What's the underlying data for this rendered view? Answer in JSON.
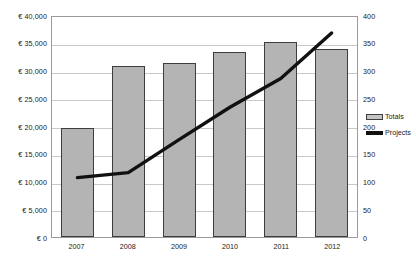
{
  "chart_data": {
    "type": "bar",
    "title": "",
    "xlabel": "",
    "ylabel": "",
    "categories": [
      "2007",
      "2008",
      "2009",
      "2010",
      "2011",
      "2012"
    ],
    "grid": true,
    "legend_position": "right",
    "axes": {
      "left": {
        "label": "",
        "ylim": [
          0,
          40000
        ],
        "tick_step": 5000,
        "ticks": [
          "€ 0",
          "€ 5,000",
          "€ 10,000",
          "€ 15,000",
          "€ 20,000",
          "€ 25,000",
          "€ 30,000",
          "€ 35,000",
          "€ 40,000"
        ],
        "tick_values": [
          0,
          5000,
          10000,
          15000,
          20000,
          25000,
          30000,
          35000,
          40000
        ]
      },
      "right": {
        "label": "",
        "ylim": [
          0,
          400
        ],
        "tick_step": 50,
        "ticks": [
          "0",
          "50",
          "100",
          "150",
          "200",
          "250",
          "300",
          "350",
          "400"
        ],
        "tick_values": [
          0,
          50,
          100,
          150,
          200,
          250,
          300,
          350,
          400
        ]
      }
    },
    "series": [
      {
        "name": "Totals",
        "type": "bar",
        "axis": "left",
        "color": "#b4b4b4",
        "border_color": "#3d3d3d",
        "values": [
          19700,
          30900,
          31400,
          33400,
          35100,
          33900
        ]
      },
      {
        "name": "Projects",
        "type": "line",
        "axis": "right",
        "color": "#111111",
        "values": [
          108,
          117,
          177,
          236,
          288,
          371
        ]
      }
    ]
  },
  "legend": {
    "items": [
      {
        "label": "Totals",
        "marker": "bar-swatch"
      },
      {
        "label": "Projects",
        "marker": "line-swatch"
      }
    ]
  }
}
